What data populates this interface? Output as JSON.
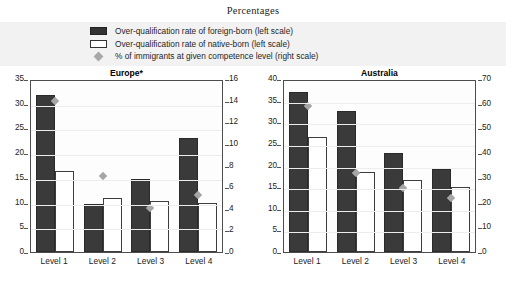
{
  "figure": {
    "title": "Percentages"
  },
  "legend": {
    "items": [
      {
        "key": "dark-swatch",
        "label": "Over-qualification rate of foreign-born (left scale)"
      },
      {
        "key": "light-swatch",
        "label": "Over-qualification rate of native-born (left scale)"
      },
      {
        "key": "diamond-marker",
        "label": "% of immigrants at given competence level (right scale)"
      }
    ]
  },
  "colors": {
    "foreign_born_bar": "#3a3a3a",
    "native_born_bar": "#ffffff",
    "native_born_border": "#3d3d3d",
    "marker": "#a6a6a6",
    "legend_band": "#f2f2f2",
    "axis": "#4d4d4d"
  },
  "chart_data": [
    {
      "type": "bar",
      "title": "Europe*",
      "xlabel": "",
      "ylabel": "",
      "categories": [
        "Level 1",
        "Level 2",
        "Level 3",
        "Level 4"
      ],
      "series": [
        {
          "name": "Over-qualification rate of foreign-born (left scale)",
          "axis": "left",
          "values": [
            31.8,
            9.7,
            14.7,
            23.1
          ]
        },
        {
          "name": "Over-qualification rate of native-born (left scale)",
          "axis": "left",
          "values": [
            16.3,
            10.9,
            10.4,
            10.0
          ]
        },
        {
          "name": "% of immigrants at given competence level (right scale)",
          "axis": "right",
          "type": "scatter",
          "values": [
            14.0,
            7.0,
            4.1,
            5.3
          ]
        }
      ],
      "ylim": [
        0,
        35
      ],
      "yticks": [
        0,
        5,
        10,
        15,
        20,
        25,
        30,
        35
      ],
      "y2lim": [
        0,
        16
      ],
      "y2ticks": [
        0,
        2,
        4,
        6,
        8,
        10,
        12,
        14,
        16
      ],
      "grid": true,
      "legend_position": "top"
    },
    {
      "type": "bar",
      "title": "Australia",
      "xlabel": "",
      "ylabel": "",
      "categories": [
        "Level 1",
        "Level 2",
        "Level 3",
        "Level 4"
      ],
      "series": [
        {
          "name": "Over-qualification rate of foreign-born (left scale)",
          "axis": "left",
          "values": [
            37.1,
            32.7,
            23.0,
            19.2
          ]
        },
        {
          "name": "Over-qualification rate of native-born (left scale)",
          "axis": "left",
          "values": [
            26.5,
            18.4,
            16.7,
            15.1
          ]
        },
        {
          "name": "% of immigrants at given competence level (right scale)",
          "axis": "right",
          "type": "scatter",
          "values": [
            59.0,
            32.0,
            26.0,
            22.0
          ]
        }
      ],
      "ylim": [
        0,
        40
      ],
      "yticks": [
        0,
        5,
        10,
        15,
        20,
        25,
        30,
        35,
        40
      ],
      "y2lim": [
        0,
        70
      ],
      "y2ticks": [
        0,
        10,
        20,
        30,
        40,
        50,
        60,
        70
      ],
      "grid": true,
      "legend_position": "top"
    }
  ]
}
